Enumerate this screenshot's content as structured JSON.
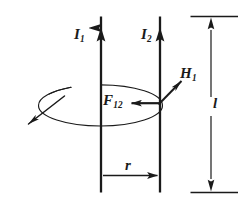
{
  "figure": {
    "background_color": "#ffffff",
    "stroke_color": "#1a1a1a",
    "width": 243,
    "height": 204,
    "labels": {
      "current_left": {
        "symbol": "I",
        "subscript": "1",
        "text": "I1"
      },
      "current_right": {
        "symbol": "I",
        "subscript": "2",
        "text": "I2"
      },
      "field": {
        "symbol": "H",
        "subscript": "1",
        "text": "H1"
      },
      "force": {
        "symbol": "F",
        "subscript": "12",
        "text": "F12"
      },
      "separation": {
        "symbol": "r",
        "subscript": "",
        "text": "r"
      },
      "length": {
        "symbol": "l",
        "subscript": "",
        "text": "l"
      }
    },
    "elements": {
      "conductor_left_name": "conductor-1",
      "conductor_right_name": "conductor-2",
      "field_loop_name": "magnetic-field-loop",
      "force_vector_name": "force-vector",
      "field_vector_name": "field-vector",
      "dimension_r_name": "separation-dimension",
      "dimension_l_name": "length-dimension"
    }
  }
}
